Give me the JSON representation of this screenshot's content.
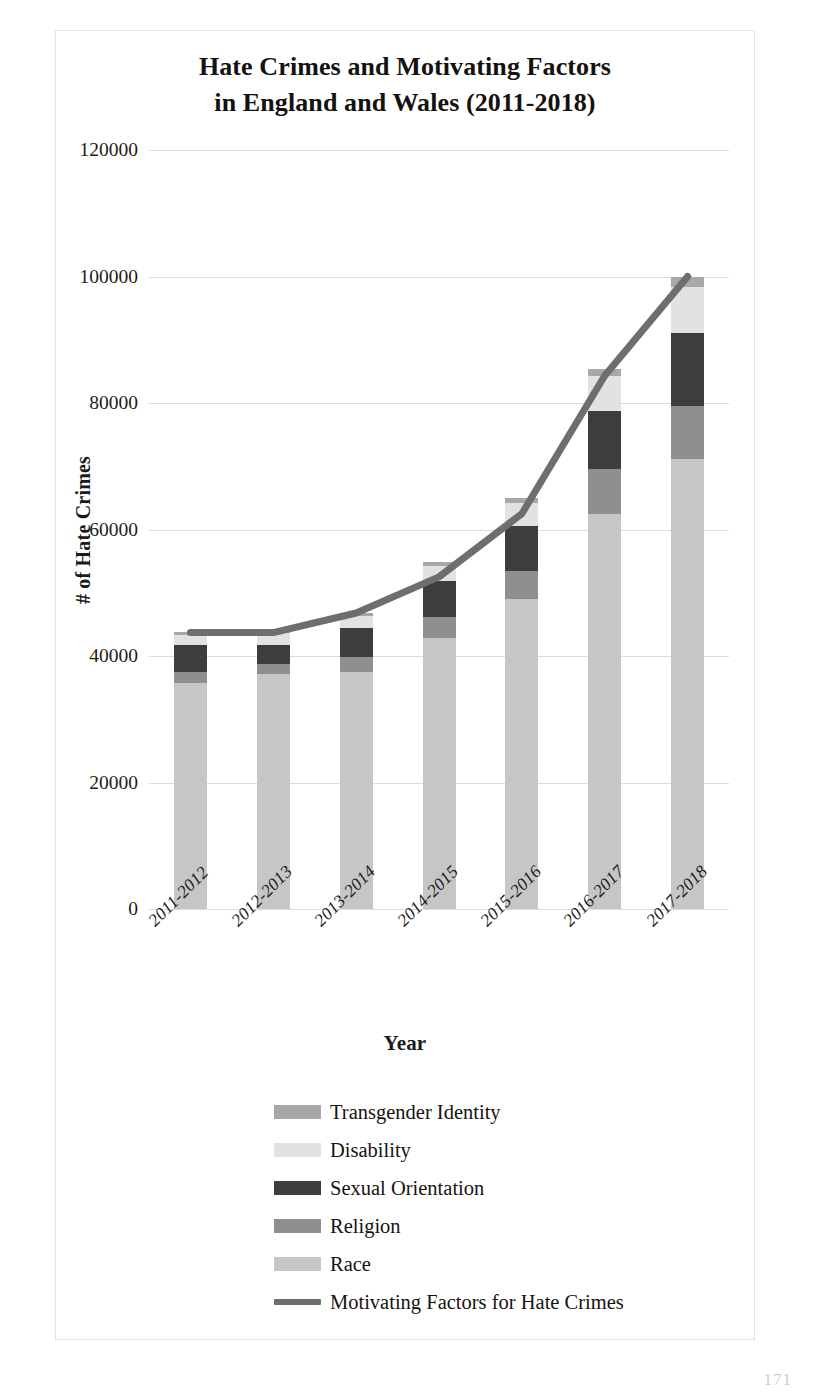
{
  "figure": {
    "title_line1": "Hate Crimes and Motivating Factors",
    "title_line2": "in England and Wales (2011-2018)",
    "page_number": "171"
  },
  "chart_data": {
    "type": "bar",
    "title": "Hate Crimes and Motivating Factors in England and Wales (2011-2018)",
    "xlabel": "Year",
    "ylabel": "# of Hate Crimes",
    "ylim": [
      0,
      120000
    ],
    "yticks": [
      0,
      20000,
      40000,
      60000,
      80000,
      100000,
      120000
    ],
    "ytick_labels": [
      "0",
      "20000",
      "40000",
      "60000",
      "80000",
      "100000",
      "120000"
    ],
    "grid": true,
    "legend_position": "below",
    "stacked": true,
    "categories": [
      "2011-2012",
      "2012-2013",
      "2013-2014",
      "2014-2015",
      "2015-2016",
      "2016-2017",
      "2017-2018"
    ],
    "series": [
      {
        "name": "Race",
        "color": "#c6c6c6",
        "values": [
          35800,
          37200,
          37500,
          42900,
          49000,
          62500,
          71200
        ]
      },
      {
        "name": "Religion",
        "color": "#8f8f8f",
        "values": [
          1600,
          1600,
          2300,
          3300,
          4400,
          7000,
          8300
        ]
      },
      {
        "name": "Sexual Orientation",
        "color": "#3d3d3d",
        "values": [
          4300,
          3000,
          4600,
          5600,
          7200,
          9200,
          11600
        ]
      },
      {
        "name": "Disability",
        "color": "#e2e2e2",
        "values": [
          1700,
          1800,
          1900,
          2500,
          3600,
          5500,
          7200
        ]
      },
      {
        "name": "Transgender Identity",
        "color": "#a8a8a8",
        "values": [
          350,
          350,
          550,
          600,
          850,
          1200,
          1600
        ]
      }
    ],
    "line_series": {
      "name": "Motivating Factors for Hate Crimes",
      "color": "#6e6e6e",
      "values": [
        43700,
        43700,
        46800,
        52500,
        62500,
        84300,
        100000
      ]
    }
  },
  "legend": {
    "items": [
      {
        "label": "Transgender Identity",
        "swatch": "#a8a8a8",
        "kind": "box"
      },
      {
        "label": "Disability",
        "swatch": "#e2e2e2",
        "kind": "box"
      },
      {
        "label": "Sexual Orientation",
        "swatch": "#3d3d3d",
        "kind": "box"
      },
      {
        "label": "Religion",
        "swatch": "#8f8f8f",
        "kind": "box"
      },
      {
        "label": "Race",
        "swatch": "#c6c6c6",
        "kind": "box"
      },
      {
        "label": "Motivating Factors for Hate Crimes",
        "swatch": "#6e6e6e",
        "kind": "line"
      }
    ]
  }
}
